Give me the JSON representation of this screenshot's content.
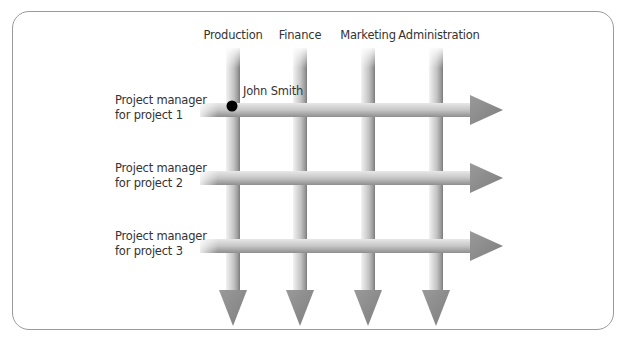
{
  "diagram": {
    "type": "matrix-organization",
    "columns": [
      {
        "label": "Production",
        "x": 233
      },
      {
        "label": "Finance",
        "x": 300
      },
      {
        "label": "Marketing",
        "x": 368
      },
      {
        "label": "Administration",
        "x": 436
      }
    ],
    "rows": [
      {
        "line1": "Project manager",
        "line2": "for project 1",
        "y": 110
      },
      {
        "line1": "Project manager",
        "line2": "for project 2",
        "y": 178
      },
      {
        "line1": "Project manager",
        "line2": "for project 3",
        "y": 246
      }
    ],
    "highlight": {
      "label": "John Smith",
      "column": "Production",
      "row": "Project manager for project 1"
    },
    "colors": {
      "bar_light": "#e4e4e4",
      "bar_mid": "#b8b8b8",
      "bar_dark": "#8a8a8a",
      "arrow_head": "#8c8c8c",
      "dot": "#000000",
      "border": "#9a9a9a"
    }
  }
}
